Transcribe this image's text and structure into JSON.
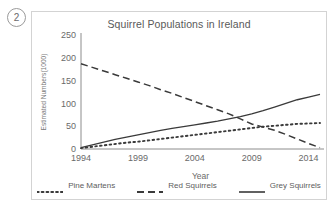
{
  "question_number": "2",
  "chart_data": {
    "type": "line",
    "title": "Squirrel Populations in Ireland",
    "xlabel": "Year",
    "ylabel": "Estimated Numbers(1000)",
    "xlim": [
      1994,
      2015
    ],
    "ylim": [
      0,
      250
    ],
    "xticks": [
      "1994",
      "1999",
      "2004",
      "2009",
      "2014"
    ],
    "xtick_values": [
      1994,
      1999,
      2004,
      2009,
      2014
    ],
    "yticks": [
      "0",
      "50",
      "100",
      "150",
      "200",
      "250"
    ],
    "ytick_values": [
      0,
      50,
      100,
      150,
      200,
      250
    ],
    "grid": false,
    "legend_position": "bottom",
    "x": [
      1994,
      1995,
      1996,
      1997,
      1998,
      1999,
      2000,
      2001,
      2002,
      2003,
      2004,
      2005,
      2006,
      2007,
      2008,
      2009,
      2010,
      2011,
      2012,
      2013,
      2014,
      2015
    ],
    "series": [
      {
        "name": "Pine Martens",
        "style": "dotted",
        "color": "#3a3a3a",
        "values": [
          2,
          5,
          8,
          11,
          14,
          16,
          19,
          22,
          25,
          28,
          31,
          34,
          37,
          40,
          43,
          46,
          49,
          51,
          53,
          55,
          56,
          57
        ]
      },
      {
        "name": "Red Squirrels",
        "style": "dashed",
        "color": "#3a3a3a",
        "values": [
          187,
          179,
          171,
          163,
          155,
          147,
          139,
          130,
          122,
          113,
          104,
          95,
          86,
          77,
          66,
          55,
          48,
          41,
          32,
          22,
          12,
          3
        ]
      },
      {
        "name": "Grey Squirrels",
        "style": "solid",
        "color": "#3a3a3a",
        "values": [
          3,
          9,
          15,
          21,
          26,
          31,
          36,
          41,
          45,
          49,
          53,
          57,
          61,
          66,
          71,
          77,
          84,
          92,
          100,
          108,
          114,
          120
        ]
      }
    ]
  },
  "legend": {
    "items": [
      {
        "label": "Pine Martens",
        "style": "dotted"
      },
      {
        "label": "Red Squirrels",
        "style": "dashed"
      },
      {
        "label": "Grey Squirrels",
        "style": "solid"
      }
    ]
  }
}
